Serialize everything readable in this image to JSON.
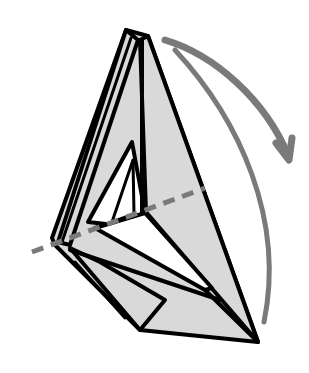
{
  "diagram": {
    "title": "",
    "kind": "origami-fold-step",
    "colors": {
      "paper": "#d9d9d9",
      "outline": "#000000",
      "arrow": "#7a7a7a",
      "fold_line": "#7a7a7a",
      "background": "#ffffff"
    },
    "elements": [
      {
        "name": "paper-model",
        "label": "folded paper"
      },
      {
        "name": "valley-fold-line",
        "label": "dashed fold line",
        "style": "dashed"
      },
      {
        "name": "fold-arrow",
        "label": "curved arrow",
        "direction": "clockwise down-right"
      }
    ]
  }
}
